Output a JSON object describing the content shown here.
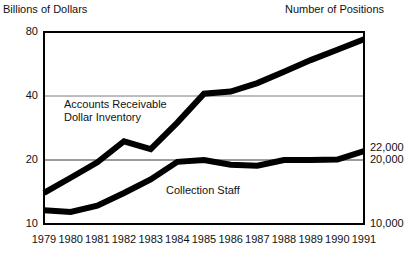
{
  "header": {
    "left_axis_title": "Billions of Dollars",
    "right_axis_title": "Number of Positions"
  },
  "chart_data": {
    "type": "line",
    "title": "",
    "subtitle": "",
    "xlabel": "",
    "ylabel": "Billions of Dollars",
    "y2label": "Number of Positions",
    "yscale": "log",
    "ylim": [
      10,
      80
    ],
    "y2lim": [
      10000,
      80000
    ],
    "grid": true,
    "legend_position": "inline-annotation",
    "x": [
      "1979",
      "1980",
      "1981",
      "1982",
      "1983",
      "1984",
      "1985",
      "1986",
      "1987",
      "1988",
      "1989",
      "1990",
      "1991"
    ],
    "categories": [
      "1979",
      "1980",
      "1981",
      "1982",
      "1983",
      "1984",
      "1985",
      "1986",
      "1987",
      "1988",
      "1989",
      "1990",
      "1991"
    ],
    "yticks_left": [
      10,
      20,
      40,
      80
    ],
    "ytick_labels_left": [
      "10",
      "20",
      "40",
      "80"
    ],
    "yticks_right": [
      10000,
      20000,
      22000
    ],
    "ytick_labels_right": [
      "10,000",
      "20,000",
      "22,000"
    ],
    "series": [
      {
        "name": "Accounts Receivable Dollar Inventory",
        "axis": "left",
        "units": "Billions of Dollars",
        "values": [
          14.0,
          16.5,
          19.5,
          24.5,
          22.5,
          30.0,
          41.0,
          42.0,
          46.0,
          52.0,
          59.0,
          66.0,
          74.0
        ]
      },
      {
        "name": "Collection Staff",
        "axis": "right",
        "units": "Number of Positions",
        "values": [
          11600,
          11400,
          12200,
          14000,
          16200,
          19600,
          20000,
          19000,
          18800,
          20000,
          20000,
          20100,
          22000
        ]
      }
    ],
    "annotations": [
      {
        "text": "Accounts Receivable Dollar Inventory",
        "target": "Accounts Receivable Dollar Inventory"
      },
      {
        "text": "Collection Staff",
        "target": "Collection Staff"
      }
    ]
  },
  "labels": {
    "accounts_receivable_line1": "Accounts Receivable",
    "accounts_receivable_line2": "Dollar Inventory",
    "collection_staff": "Collection Staff"
  },
  "colors": {
    "line": "#000000",
    "grid": "#7a7a7a",
    "frame": "#000000",
    "background": "#ffffff",
    "text": "#111111"
  }
}
